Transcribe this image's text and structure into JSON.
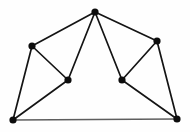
{
  "figure": {
    "width": 190,
    "height": 132,
    "background_color": "#fefefe",
    "vertex_color": "#0d0d0d",
    "edge_color": "#141414",
    "base_edge_color": "#5e5e5e",
    "vertex_radius": 3.6,
    "edge_width": 1.7,
    "base_edge_width": 1.5
  },
  "chart_data": {
    "type": "scatter",
    "xlabel": "",
    "ylabel": "",
    "xlim": [
      0,
      190
    ],
    "ylim": [
      0,
      132
    ],
    "grid": false,
    "legend": "none",
    "node_count": 7,
    "edge_count": 11,
    "nodes": [
      {
        "id": "apex",
        "label": "apex",
        "x": 95,
        "y": 12,
        "degree": 4
      },
      {
        "id": "upper-left",
        "label": "upper-left",
        "x": 32,
        "y": 46,
        "degree": 3
      },
      {
        "id": "upper-right",
        "label": "upper-right",
        "x": 157,
        "y": 41,
        "degree": 3
      },
      {
        "id": "mid-left",
        "label": "mid-left",
        "x": 68,
        "y": 80,
        "degree": 3
      },
      {
        "id": "mid-right",
        "label": "mid-right",
        "x": 122,
        "y": 80,
        "degree": 3
      },
      {
        "id": "bottom-left",
        "label": "bottom-left",
        "x": 13,
        "y": 120,
        "degree": 3
      },
      {
        "id": "bottom-right",
        "label": "bottom-right",
        "x": 177,
        "y": 119,
        "degree": 3
      }
    ],
    "edges": [
      {
        "from": "apex",
        "to": "upper-left",
        "style": "solid"
      },
      {
        "from": "apex",
        "to": "upper-right",
        "style": "solid"
      },
      {
        "from": "apex",
        "to": "mid-left",
        "style": "solid"
      },
      {
        "from": "apex",
        "to": "mid-right",
        "style": "solid"
      },
      {
        "from": "upper-left",
        "to": "mid-left",
        "style": "solid"
      },
      {
        "from": "upper-left",
        "to": "bottom-left",
        "style": "solid"
      },
      {
        "from": "mid-left",
        "to": "bottom-left",
        "style": "solid"
      },
      {
        "from": "upper-right",
        "to": "mid-right",
        "style": "solid"
      },
      {
        "from": "upper-right",
        "to": "bottom-right",
        "style": "solid"
      },
      {
        "from": "mid-right",
        "to": "bottom-right",
        "style": "solid"
      },
      {
        "from": "bottom-left",
        "to": "bottom-right",
        "style": "base"
      }
    ]
  }
}
